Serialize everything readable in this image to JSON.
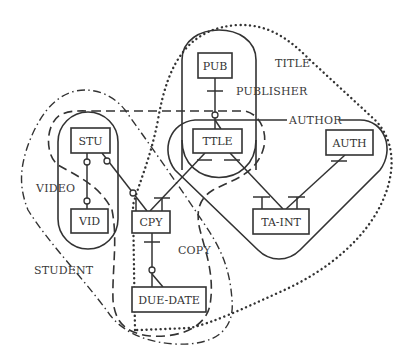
{
  "diagram": {
    "type": "entity-relationship overlay diagram",
    "entities": [
      {
        "id": "pub",
        "label": "PUB"
      },
      {
        "id": "ttle",
        "label": "TTLE"
      },
      {
        "id": "stu",
        "label": "STU"
      },
      {
        "id": "vid",
        "label": "VID"
      },
      {
        "id": "cpy",
        "label": "CPY"
      },
      {
        "id": "auth",
        "label": "AUTH"
      },
      {
        "id": "ta_int",
        "label": "TA-INT"
      },
      {
        "id": "due_date",
        "label": "DUE-DATE"
      }
    ],
    "region_labels": {
      "title": "TITLE",
      "publisher": "PUBLISHER",
      "author": "AUTHOR",
      "video": "VIDEO",
      "student": "STUDENT",
      "copy": "COPY"
    },
    "region_styles": {
      "title": "dotted",
      "publisher": "solid",
      "author": "solid",
      "video": "solid",
      "student": "dash-dot",
      "copy": "dashed"
    },
    "relationships": [
      {
        "from": "PUB",
        "to": "TTLE",
        "ends": "one-bar / optional"
      },
      {
        "from": "STU",
        "to": "VID",
        "ends": "optional / optional"
      },
      {
        "from": "STU",
        "to": "CPY",
        "ends": "optional / optional-many"
      },
      {
        "from": "TTLE",
        "to": "CPY",
        "ends": "one / many"
      },
      {
        "from": "TTLE",
        "to": "TA-INT",
        "ends": "one / many"
      },
      {
        "from": "AUTH",
        "to": "TA-INT",
        "ends": "one / many"
      },
      {
        "from": "CPY",
        "to": "DUE-DATE",
        "ends": "one / optional-many"
      }
    ]
  }
}
